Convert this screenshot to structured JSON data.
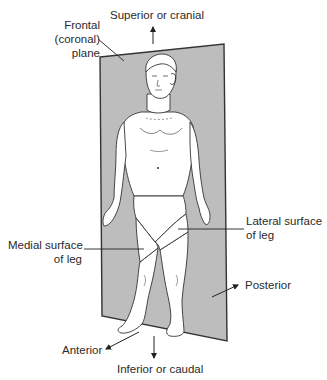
{
  "figure": {
    "plane_fill": "#bdbdbd",
    "outline_color": "#333333",
    "skin_fill": "#ffffff"
  },
  "labels": {
    "frontal_plane": {
      "line1": "Frontal",
      "line2": "(coronal)",
      "line3": "plane"
    },
    "superior": "Superior or cranial",
    "inferior": "Inferior or caudal",
    "lateral_surface": {
      "line1": "Lateral surface",
      "line2": "of leg"
    },
    "medial_surface": {
      "line1": "Medial surface",
      "line2": "of leg"
    },
    "posterior": "Posterior",
    "anterior": "Anterior"
  },
  "icons": {
    "arrow_up": "superior-arrow",
    "arrow_down": "inferior-arrow",
    "arrow_posterior": "posterior-arrow",
    "arrow_anterior": "anterior-arrow"
  }
}
